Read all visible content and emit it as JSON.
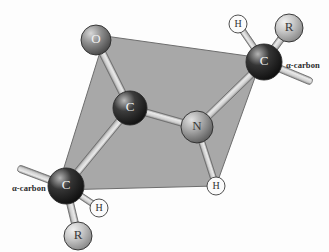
{
  "figure": {
    "background_color": "#fdfdfd",
    "plane_color": "#a8a8a8",
    "plane_edge_color": "#6e6e6e",
    "bond_color": "#d2d2d2",
    "bond_edge_color": "#6b6b6b"
  },
  "plane": {
    "name": "peptide-plane",
    "points": "105,36 262,58 216,186 57,190"
  },
  "atoms": [
    {
      "id": "oxygen",
      "label": "O",
      "cx": 96,
      "cy": 40,
      "r": 15,
      "color": "#8f8f8f",
      "highlight": "#d8d8d8",
      "shadow": "#4a4a4a",
      "text_color": "light"
    },
    {
      "id": "carbonyl-carbon",
      "label": "C",
      "cx": 130,
      "cy": 108,
      "r": 17,
      "color": "#3c3c3c",
      "highlight": "#b9b9b9",
      "shadow": "#131313",
      "text_color": "light"
    },
    {
      "id": "nitrogen",
      "label": "N",
      "cx": 197,
      "cy": 127,
      "r": 16,
      "color": "#a9a9a9",
      "highlight": "#e2e2e2",
      "shadow": "#5f5f5f",
      "text_color": "dark"
    },
    {
      "id": "alpha-carbon-right",
      "label": "C",
      "cx": 264,
      "cy": 62,
      "r": 18,
      "color": "#353535",
      "highlight": "#b4b4b4",
      "shadow": "#101010",
      "text_color": "light"
    },
    {
      "id": "alpha-carbon-left",
      "label": "C",
      "cx": 66,
      "cy": 186,
      "r": 18,
      "color": "#353535",
      "highlight": "#b4b4b4",
      "shadow": "#101010",
      "text_color": "light"
    },
    {
      "id": "r-group-right",
      "label": "R",
      "cx": 289,
      "cy": 28,
      "r": 14,
      "color": "#c9c9c9",
      "highlight": "#f0f0f0",
      "shadow": "#8a8a8a",
      "text_color": "dark"
    },
    {
      "id": "r-group-left",
      "label": "R",
      "cx": 78,
      "cy": 236,
      "r": 14,
      "color": "#c9c9c9",
      "highlight": "#f0f0f0",
      "shadow": "#8a8a8a",
      "text_color": "dark"
    }
  ],
  "hydrogens": [
    {
      "id": "hydrogen-right-alpha",
      "label": "H",
      "cx": 238,
      "cy": 24,
      "r": 9
    },
    {
      "id": "hydrogen-amide",
      "label": "H",
      "cx": 216,
      "cy": 186,
      "r": 9
    },
    {
      "id": "hydrogen-left-alpha",
      "label": "H",
      "cx": 99,
      "cy": 208,
      "r": 9
    }
  ],
  "bonds": [
    {
      "id": "bond-oxygen-carbonyl-carbon",
      "x1": 96,
      "y1": 40,
      "x2": 130,
      "y2": 108,
      "width": 7
    },
    {
      "id": "bond-carbonyl-carbon-nitrogen",
      "x1": 130,
      "y1": 108,
      "x2": 197,
      "y2": 127,
      "width": 7
    },
    {
      "id": "bond-carbonyl-carbon-alpha-carbon-left",
      "x1": 130,
      "y1": 108,
      "x2": 66,
      "y2": 186,
      "width": 7
    },
    {
      "id": "bond-nitrogen-alpha-carbon-right",
      "x1": 197,
      "y1": 127,
      "x2": 264,
      "y2": 62,
      "width": 7
    },
    {
      "id": "bond-nitrogen-hydrogen-amide",
      "x1": 197,
      "y1": 127,
      "x2": 216,
      "y2": 186,
      "width": 6
    },
    {
      "id": "bond-alpha-carbon-right-hydrogen",
      "x1": 264,
      "y1": 62,
      "x2": 238,
      "y2": 24,
      "width": 6
    },
    {
      "id": "bond-alpha-carbon-right-r-group",
      "x1": 264,
      "y1": 62,
      "x2": 289,
      "y2": 28,
      "width": 7
    },
    {
      "id": "bond-alpha-carbon-right-chain",
      "x1": 264,
      "y1": 62,
      "x2": 312,
      "y2": 82,
      "width": 7
    },
    {
      "id": "bond-alpha-carbon-left-hydrogen",
      "x1": 66,
      "y1": 186,
      "x2": 99,
      "y2": 208,
      "width": 6
    },
    {
      "id": "bond-alpha-carbon-left-r-group",
      "x1": 66,
      "y1": 186,
      "x2": 78,
      "y2": 236,
      "width": 7
    },
    {
      "id": "bond-alpha-carbon-left-chain",
      "x1": 66,
      "y1": 186,
      "x2": 18,
      "y2": 168,
      "width": 7
    }
  ],
  "callouts": [
    {
      "id": "alpha-carbon-label-right",
      "text": "α-carbon",
      "left": 286,
      "top": 60
    },
    {
      "id": "alpha-carbon-label-left",
      "text": "α-carbon",
      "left": 12,
      "top": 183
    }
  ]
}
